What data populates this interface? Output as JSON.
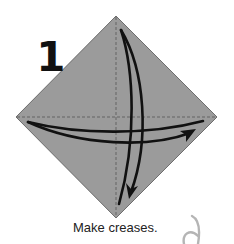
{
  "diagram": {
    "step_number": "1",
    "caption": "Make creases.",
    "colors": {
      "paper_fill": "#9b9b9b",
      "paper_edge": "#555555",
      "crease_line": "#555555",
      "arrow": "#111111",
      "corner_glyph": "#b5b5b5",
      "background": "#ffffff"
    },
    "shapes": {
      "paper": "diamond-square",
      "creases": [
        "vertical-dashed-crease",
        "horizontal-dashed-crease"
      ],
      "arrows": [
        "vertical-fold-unfold-arrow",
        "horizontal-fold-unfold-arrow"
      ]
    }
  }
}
